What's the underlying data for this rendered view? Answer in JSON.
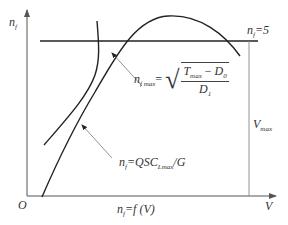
{
  "diagram": {
    "axes": {
      "y_label_main": "n",
      "y_label_sub": "f",
      "x_label": "V",
      "origin_label": "O"
    },
    "lines": {
      "nf5_label_main": "n",
      "nf5_label_sub": "f",
      "nf5_label_rest": "=5",
      "vmax_label_main": "V",
      "vmax_label_sub": "max"
    },
    "formulas": {
      "nfmax": {
        "lhs_main": "n",
        "lhs_sub": "f max",
        "eq": "=",
        "numerator_T": "T",
        "numerator_T_sub": "max",
        "numerator_minus": "−",
        "numerator_D": "D",
        "numerator_D_sub": "0",
        "denominator_D": "D",
        "denominator_D_sub": "1"
      },
      "nf_qsc": {
        "lhs_main": "n",
        "lhs_sub": "f",
        "rhs_pre": "=QSC",
        "rhs_sub": "Lmax",
        "rhs_post": "/G"
      },
      "nf_fv": {
        "lhs_main": "n",
        "lhs_sub": "f",
        "rhs": "=f (V)"
      }
    },
    "colors": {
      "curve": "#222222",
      "axis": "#555555",
      "thin_line": "#777777",
      "text": "#333333"
    }
  }
}
